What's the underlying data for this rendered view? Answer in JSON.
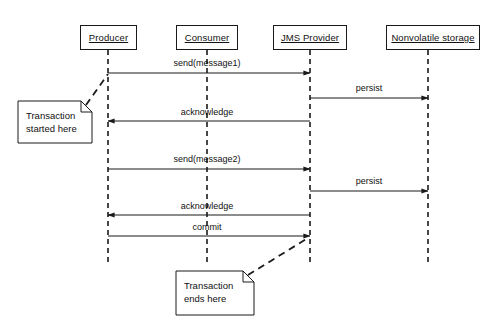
{
  "diagram": {
    "type": "uml-sequence-diagram",
    "background_color": "#ffffff",
    "line_color": "#1a1a1a"
  },
  "participants": [
    {
      "id": "producer",
      "label": "Producer",
      "x": 108,
      "box_left": 80,
      "box_top": 25,
      "box_width": 57,
      "box_height": 25
    },
    {
      "id": "consumer",
      "label": "Consumer",
      "x": 207,
      "box_left": 176,
      "box_top": 25,
      "box_width": 62,
      "box_height": 25
    },
    {
      "id": "jms",
      "label": "JMS Provider",
      "x": 310,
      "box_left": 273,
      "box_top": 25,
      "box_width": 74,
      "box_height": 25
    },
    {
      "id": "storage",
      "label": "Nonvolatile storage",
      "x": 428,
      "box_left": 386,
      "box_top": 25,
      "box_width": 94,
      "box_height": 25
    }
  ],
  "lifelines": {
    "top": 50,
    "bottom": 262,
    "style": "dashed"
  },
  "messages": [
    {
      "id": "send1",
      "label": "send(message1)",
      "from": "producer",
      "to": "jms",
      "y": 73,
      "direction": "right",
      "label_y": 58,
      "label_x": 207
    },
    {
      "id": "persist1",
      "label": "persist",
      "from": "jms",
      "to": "storage",
      "y": 98,
      "direction": "right",
      "label_y": 83,
      "label_x": 369
    },
    {
      "id": "ack1",
      "label": "acknowledge",
      "from": "jms",
      "to": "producer",
      "y": 121,
      "direction": "left",
      "label_y": 107,
      "label_x": 207
    },
    {
      "id": "send2",
      "label": "send(message2)",
      "from": "producer",
      "to": "jms",
      "y": 169,
      "direction": "right",
      "label_y": 154,
      "label_x": 207
    },
    {
      "id": "persist2",
      "label": "persist",
      "from": "jms",
      "to": "storage",
      "y": 191,
      "direction": "right",
      "label_y": 176,
      "label_x": 369
    },
    {
      "id": "ack2",
      "label": "acknowledge",
      "from": "jms",
      "to": "producer",
      "y": 215,
      "direction": "left",
      "label_y": 201,
      "label_x": 207
    },
    {
      "id": "commit",
      "label": "commit",
      "from": "producer",
      "to": "jms",
      "y": 236,
      "direction": "right",
      "label_y": 222,
      "label_x": 207
    }
  ],
  "notes": [
    {
      "id": "transaction-started",
      "text": "Transaction\nstarted here",
      "left": 18,
      "top": 101,
      "width": 74,
      "height": 42,
      "fold": 11,
      "text_left": 26,
      "text_top": 110,
      "connector": {
        "x1": 86,
        "y1": 105,
        "x2": 108,
        "y2": 74
      }
    },
    {
      "id": "transaction-ends",
      "text": "Transaction\nends here",
      "left": 176,
      "top": 271,
      "width": 78,
      "height": 44,
      "fold": 11,
      "text_left": 184,
      "text_top": 280,
      "connector": {
        "x1": 248,
        "y1": 275,
        "x2": 308,
        "y2": 238
      }
    }
  ]
}
